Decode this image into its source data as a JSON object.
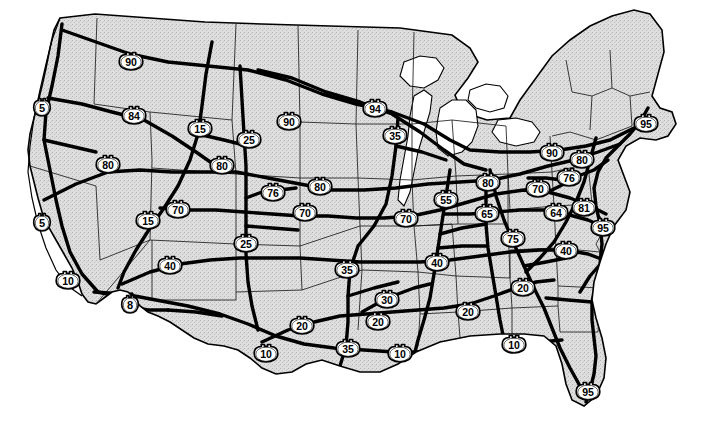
{
  "map": {
    "title": "United States Interstate Highway System Map",
    "kind": "reference-map",
    "width": 704,
    "height": 445,
    "colors": {
      "land_fill": "#dcdcdc",
      "water_fill": "#ffffff",
      "background": "#ffffff",
      "state_border": "#1a1a1a",
      "coastline": "#000000",
      "highway": "#000000",
      "shield_fill": "#ffffff",
      "shield_stroke": "#000000",
      "shield_text": "#000000"
    },
    "legend_present": false,
    "labels_present": false,
    "description": "Black and white line map of the contiguous United States showing state outlines with a light gray stippled land fill, white Great Lakes, and the Interstate Highway network drawn as heavy black lines annotated with numbered interstate shield markers."
  },
  "shields": [
    {
      "id": "i90-mt",
      "route": "90",
      "x": 131,
      "y": 61,
      "region": "Montana"
    },
    {
      "id": "i5-wa",
      "route": "5",
      "x": 42,
      "y": 107,
      "region": "Washington"
    },
    {
      "id": "i84-or",
      "route": "84",
      "x": 134,
      "y": 115,
      "region": "Oregon"
    },
    {
      "id": "i15-id",
      "route": "15",
      "x": 200,
      "y": 128,
      "region": "Idaho"
    },
    {
      "id": "i90-sd",
      "route": "90",
      "x": 289,
      "y": 121,
      "region": "South Dakota"
    },
    {
      "id": "i94-nd",
      "route": "94",
      "x": 375,
      "y": 108,
      "region": "North Dakota"
    },
    {
      "id": "i35-mn",
      "route": "35",
      "x": 395,
      "y": 135,
      "region": "Minnesota"
    },
    {
      "id": "i25-wy",
      "route": "25",
      "x": 249,
      "y": 139,
      "region": "Wyoming"
    },
    {
      "id": "i80-nv",
      "route": "80",
      "x": 108,
      "y": 164,
      "region": "Nevada"
    },
    {
      "id": "i80-ne",
      "route": "80",
      "x": 222,
      "y": 165,
      "region": "Nebraska"
    },
    {
      "id": "i80-ia",
      "route": "80",
      "x": 320,
      "y": 186,
      "region": "Iowa"
    },
    {
      "id": "i90-ny",
      "route": "90",
      "x": 552,
      "y": 152,
      "region": "New York"
    },
    {
      "id": "i80-pa",
      "route": "80",
      "x": 582,
      "y": 159,
      "region": "Pennsylvania"
    },
    {
      "id": "i95-me",
      "route": "95",
      "x": 646,
      "y": 123,
      "region": "Maine"
    },
    {
      "id": "i76-pa",
      "route": "76",
      "x": 569,
      "y": 177,
      "region": "Pennsylvania"
    },
    {
      "id": "i80-oh",
      "route": "80",
      "x": 488,
      "y": 182,
      "region": "Ohio"
    },
    {
      "id": "i70-oh",
      "route": "70",
      "x": 538,
      "y": 188,
      "region": "Ohio"
    },
    {
      "id": "i76-co",
      "route": "76",
      "x": 273,
      "y": 192,
      "region": "Colorado"
    },
    {
      "id": "i70-ut",
      "route": "70",
      "x": 178,
      "y": 209,
      "region": "Utah"
    },
    {
      "id": "i15-ut",
      "route": "15",
      "x": 148,
      "y": 220,
      "region": "Utah"
    },
    {
      "id": "i5-ca",
      "route": "5",
      "x": 42,
      "y": 222,
      "region": "California"
    },
    {
      "id": "i70-co",
      "route": "70",
      "x": 305,
      "y": 212,
      "region": "Colorado"
    },
    {
      "id": "i70-mo",
      "route": "70",
      "x": 406,
      "y": 218,
      "region": "Missouri"
    },
    {
      "id": "i55-il",
      "route": "55",
      "x": 446,
      "y": 199,
      "region": "Illinois"
    },
    {
      "id": "i65-in",
      "route": "65",
      "x": 487,
      "y": 213,
      "region": "Indiana"
    },
    {
      "id": "i64-wv",
      "route": "64",
      "x": 556,
      "y": 212,
      "region": "West Virginia"
    },
    {
      "id": "i81-va",
      "route": "81",
      "x": 584,
      "y": 207,
      "region": "Virginia"
    },
    {
      "id": "i95-va",
      "route": "95",
      "x": 603,
      "y": 227,
      "region": "Virginia"
    },
    {
      "id": "i75-ky",
      "route": "75",
      "x": 513,
      "y": 238,
      "region": "Kentucky"
    },
    {
      "id": "i25-nm",
      "route": "25",
      "x": 246,
      "y": 243,
      "region": "New Mexico"
    },
    {
      "id": "i40-nm",
      "route": "40",
      "x": 170,
      "y": 265,
      "region": "New Mexico"
    },
    {
      "id": "i40-nc",
      "route": "40",
      "x": 566,
      "y": 250,
      "region": "North Carolina"
    },
    {
      "id": "i10-az",
      "route": "10",
      "x": 68,
      "y": 280,
      "region": "Arizona"
    },
    {
      "id": "i8-ca",
      "route": "8",
      "x": 130,
      "y": 304,
      "region": "California"
    },
    {
      "id": "i35-ok",
      "route": "35",
      "x": 347,
      "y": 269,
      "region": "Oklahoma"
    },
    {
      "id": "i40-tn",
      "route": "40",
      "x": 437,
      "y": 262,
      "region": "Tennessee"
    },
    {
      "id": "i20-sc",
      "route": "20",
      "x": 523,
      "y": 287,
      "region": "South Carolina"
    },
    {
      "id": "i30-tx",
      "route": "30",
      "x": 387,
      "y": 299,
      "region": "Texas"
    },
    {
      "id": "i20-tx",
      "route": "20",
      "x": 302,
      "y": 325,
      "region": "Texas"
    },
    {
      "id": "i20-la",
      "route": "20",
      "x": 378,
      "y": 321,
      "region": "Louisiana"
    },
    {
      "id": "i20-ms",
      "route": "20",
      "x": 468,
      "y": 311,
      "region": "Mississippi"
    },
    {
      "id": "i35-tx",
      "route": "35",
      "x": 348,
      "y": 348,
      "region": "Texas"
    },
    {
      "id": "i10-tx",
      "route": "10",
      "x": 266,
      "y": 353,
      "region": "Texas"
    },
    {
      "id": "i10-la",
      "route": "10",
      "x": 400,
      "y": 353,
      "region": "Louisiana"
    },
    {
      "id": "i10-fl",
      "route": "10",
      "x": 514,
      "y": 344,
      "region": "Florida"
    },
    {
      "id": "i95-fl",
      "route": "95",
      "x": 588,
      "y": 391,
      "region": "Florida"
    }
  ]
}
